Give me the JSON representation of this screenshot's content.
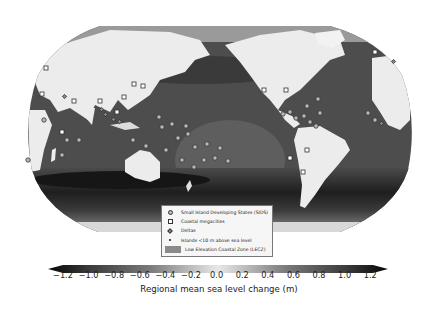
{
  "map": {
    "projection": "Robinson (Pacific-centred)",
    "ocean_shade_base": "#4a4a4a",
    "land_color": "#ececec",
    "southern_ocean_band_color": "#2a2a2a"
  },
  "legend": {
    "items": [
      {
        "symbol": "circle",
        "label": "Small Island Developing States (SIDS)"
      },
      {
        "symbol": "square",
        "label": "Coastal megacities"
      },
      {
        "symbol": "diamond",
        "label": "Deltas"
      },
      {
        "symbol": "dot",
        "label": "Islands <10 m above sea level"
      },
      {
        "symbol": "patch",
        "label": "Low Elevation Coastal Zone (LECZ)"
      }
    ]
  },
  "colorbar": {
    "ticks": [
      "−1.2",
      "−1.0",
      "−0.8",
      "−0.6",
      "−0.4",
      "−0.2",
      "0.0",
      "0.2",
      "0.4",
      "0.6",
      "0.8",
      "1.0",
      "1.2"
    ],
    "label": "Regional mean sea level change (m)",
    "min": -1.2,
    "max": 1.2,
    "extend": "both",
    "colors": [
      "#050505",
      "#3a3a3a",
      "#7a7a7a",
      "#bdbdbd",
      "#e8e8e8",
      "#bdbdbd",
      "#7a7a7a",
      "#3a3a3a",
      "#050505"
    ]
  }
}
